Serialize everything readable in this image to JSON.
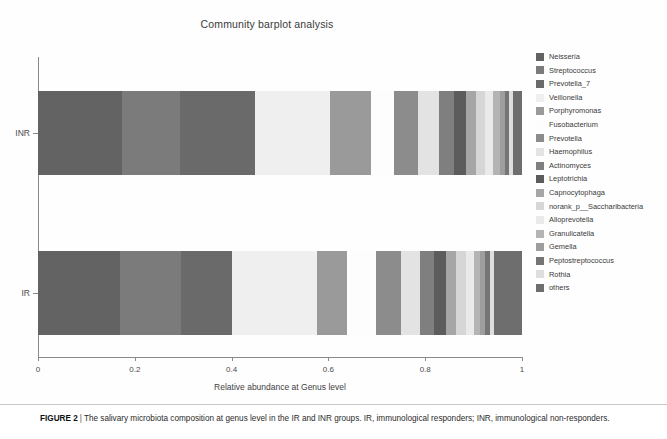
{
  "figure": {
    "caption_label": "FIGURE 2",
    "caption_separator": "|",
    "caption_text": "The salivary microbiota composition at genus level in the IR and INR groups. IR, immunological responders; INR, immunological non-responders."
  },
  "chart_data": {
    "type": "bar",
    "orientation": "horizontal",
    "stacked": true,
    "title": "Community barplot analysis",
    "xlabel": "Relative abundance at Genus level",
    "ylabel": "",
    "xlim": [
      0,
      1
    ],
    "xticks": [
      "0",
      "0.2",
      "0.4",
      "0.6",
      "0.8",
      "1"
    ],
    "xtick_values": [
      0,
      0.2,
      0.4,
      0.6,
      0.8,
      1
    ],
    "grid": false,
    "legend_position": "right",
    "categories": [
      "INR",
      "IR"
    ],
    "series": [
      {
        "name": "Neisseria",
        "color": "#636363",
        "values": [
          0.174,
          0.17
        ]
      },
      {
        "name": "Streptococcus",
        "color": "#7b7b7b",
        "values": [
          0.12,
          0.126
        ]
      },
      {
        "name": "Prevotella_7",
        "color": "#6a6a6a",
        "values": [
          0.155,
          0.104
        ]
      },
      {
        "name": "Veillonella",
        "color": "#efefef",
        "values": [
          0.155,
          0.176
        ]
      },
      {
        "name": "Porphyromonas",
        "color": "#9a9a9a",
        "values": [
          0.083,
          0.062
        ]
      },
      {
        "name": "Fusobacterium",
        "color": "#fdfdfd",
        "values": [
          0.048,
          0.06
        ]
      },
      {
        "name": "Prevotella",
        "color": "#8c8c8c",
        "values": [
          0.05,
          0.052
        ]
      },
      {
        "name": "Haemophilus",
        "color": "#e3e3e3",
        "values": [
          0.043,
          0.04
        ]
      },
      {
        "name": "Actinomyces",
        "color": "#7f7f7f",
        "values": [
          0.031,
          0.029
        ]
      },
      {
        "name": "Leptotrichia",
        "color": "#5c5c5c",
        "values": [
          0.025,
          0.024
        ]
      },
      {
        "name": "Capnocytophaga",
        "color": "#a6a6a6",
        "values": [
          0.021,
          0.021
        ]
      },
      {
        "name": "norank_p__Saccharibacteria",
        "color": "#d6d6d6",
        "values": [
          0.019,
          0.02
        ]
      },
      {
        "name": "Alloprevotella",
        "color": "#eaeaea",
        "values": [
          0.017,
          0.016
        ]
      },
      {
        "name": "Granulicatella",
        "color": "#b4b4b4",
        "values": [
          0.013,
          0.013
        ]
      },
      {
        "name": "Gemella",
        "color": "#9e9e9e",
        "values": [
          0.011,
          0.011
        ]
      },
      {
        "name": "Peptostreptococcus",
        "color": "#757575",
        "values": [
          0.009,
          0.009
        ]
      },
      {
        "name": "Rothia",
        "color": "#dedede",
        "values": [
          0.008,
          0.009
        ]
      },
      {
        "name": "others",
        "color": "#6e6e6e",
        "values": [
          0.018,
          0.058
        ]
      }
    ]
  }
}
